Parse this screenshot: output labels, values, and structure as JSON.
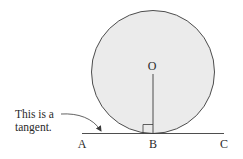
{
  "diagram": {
    "colors": {
      "circle_fill": "#ebebeb",
      "stroke": "#3a3a3a",
      "text": "#2a2a2a",
      "background": "#ffffff"
    },
    "points": {
      "center": "O",
      "left": "A",
      "tangent_point": "B",
      "right": "C"
    },
    "annotation": {
      "line1": "This is a",
      "line2": "tangent."
    }
  }
}
